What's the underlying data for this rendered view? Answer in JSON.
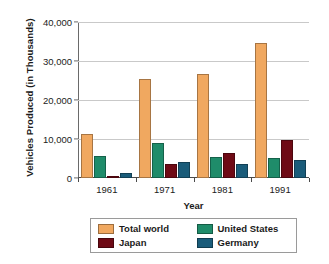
{
  "chart_data": {
    "type": "bar",
    "title": "",
    "xlabel": "Year",
    "ylabel": "Vehicles Produced (in Thousands)",
    "categories": [
      "1961",
      "1971",
      "1981",
      "1991"
    ],
    "series": [
      {
        "name": "Total world",
        "color": "#F0A860",
        "values": [
          11300,
          25400,
          26600,
          34600
        ]
      },
      {
        "name": "United States",
        "color": "#1F8C6A",
        "values": [
          5700,
          9000,
          5400,
          5200
        ]
      },
      {
        "name": "Japan",
        "color": "#6E0A15",
        "values": [
          250,
          3600,
          6300,
          9700
        ]
      },
      {
        "name": "Germany",
        "color": "#1A5C7A",
        "values": [
          1400,
          4100,
          3600,
          4600
        ]
      }
    ],
    "ylim": [
      0,
      40000
    ],
    "yticks": [
      0,
      10000,
      20000,
      30000,
      40000
    ],
    "ytick_labels": [
      "0",
      "10,000",
      "20,000",
      "30,000",
      "40,000"
    ],
    "grid": true,
    "legend_position": "bottom"
  },
  "legend": {
    "items": [
      {
        "label": "Total world"
      },
      {
        "label": "United States"
      },
      {
        "label": "Japan"
      },
      {
        "label": "Germany"
      }
    ]
  }
}
